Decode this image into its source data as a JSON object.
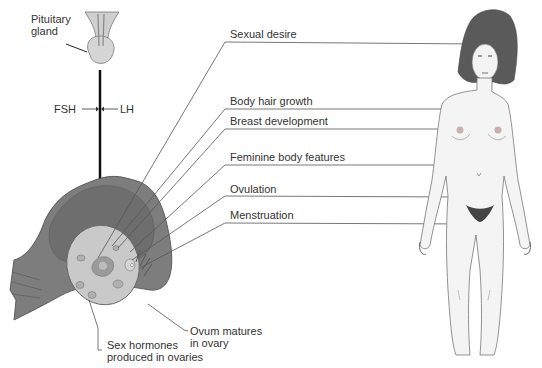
{
  "diagram": {
    "pituitary_label_line1": "Pituitary",
    "pituitary_label_line2": "gland",
    "fsh": "FSH",
    "lh": "LH",
    "effects": [
      {
        "label": "Sexual desire"
      },
      {
        "label": "Body hair growth"
      },
      {
        "label": "Breast development"
      },
      {
        "label": "Feminine body features"
      },
      {
        "label": "Ovulation"
      },
      {
        "label": "Menstruation"
      }
    ],
    "ovum_line1": "Ovum matures",
    "ovum_line2": "in ovary",
    "hormones_line1": "Sex hormones",
    "hormones_line2": "produced in ovaries",
    "colors": {
      "line": "#555555",
      "uterus": "#7d7d7d",
      "ovary": "#c9c9c9",
      "hair": "#5a5a5a",
      "skin": "#f4f4f4"
    }
  }
}
